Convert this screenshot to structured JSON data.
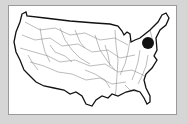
{
  "map": {
    "subject": "Contiguous United States river network",
    "marker": {
      "label": "location-marker",
      "cx": 148,
      "cy": 43,
      "r": 6,
      "color": "#111111"
    },
    "colors": {
      "background": "#d6d6d6",
      "panel": "#ffffff",
      "panel_border": "#9a9a9a",
      "outline": "#111111",
      "rivers": "#8a8a8a"
    }
  }
}
